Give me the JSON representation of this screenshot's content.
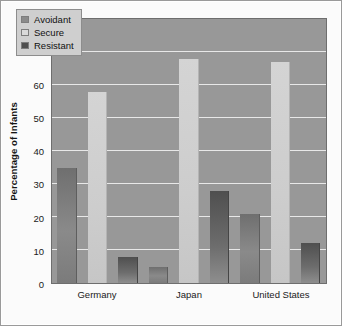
{
  "chart_data": {
    "type": "bar",
    "title": "",
    "subtitle": "",
    "xlabel": "",
    "ylabel": "Percentage of Infants",
    "categories": [
      "Germany",
      "Japan",
      "United States"
    ],
    "series": [
      {
        "name": "Avoidant",
        "values": [
          35,
          5,
          21
        ],
        "color": "#8a8a8a"
      },
      {
        "name": "Secure",
        "values": [
          58,
          68,
          67
        ],
        "color": "#d4d4d4"
      },
      {
        "name": "Resistant",
        "values": [
          8,
          28,
          12
        ],
        "color": "#4f4f4f"
      }
    ],
    "ylim": [
      0,
      80
    ],
    "yticks": [
      0,
      10,
      20,
      30,
      40,
      50,
      60,
      70,
      80
    ],
    "ytick_labels": [
      "0",
      "10",
      "20",
      "30",
      "40",
      "50",
      "60",
      "70",
      "80"
    ],
    "grid": true,
    "legend_position": "top-left",
    "plot_background": "#989898",
    "gridline_color": "#e8e8e8",
    "figure_background": "#fbfbfb"
  },
  "legend": {
    "items": [
      {
        "label": "Avoidant"
      },
      {
        "label": "Secure"
      },
      {
        "label": "Resistant"
      }
    ]
  }
}
